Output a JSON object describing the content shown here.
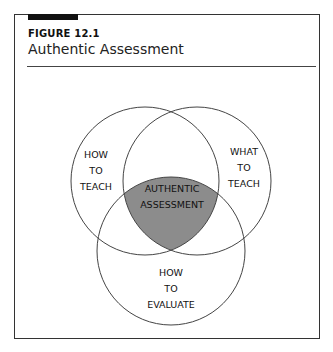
{
  "figure": {
    "number": "FIGURE 12.1",
    "title": "Authentic Assessment"
  },
  "diagram": {
    "type": "venn",
    "colors": {
      "overlap_fill": "#8c8c8c",
      "stroke": "#444444"
    },
    "sets": [
      {
        "name": "how-to-teach",
        "lines": [
          "HOW",
          "TO",
          "TEACH"
        ]
      },
      {
        "name": "what-to-teach",
        "lines": [
          "WHAT",
          "TO",
          "TEACH"
        ]
      },
      {
        "name": "how-to-evaluate",
        "lines": [
          "HOW",
          "TO",
          "EVALUATE"
        ]
      }
    ],
    "center": {
      "name": "authentic-assessment",
      "lines": [
        "AUTHENTIC",
        "ASSESSMENT"
      ]
    }
  }
}
